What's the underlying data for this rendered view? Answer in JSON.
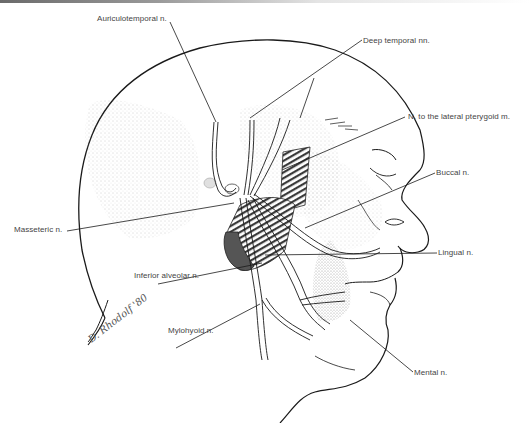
{
  "figure": {
    "signature": "D. Rhodolf '80",
    "colors": {
      "ink": "#1a1a1a",
      "label_text": "#444444",
      "stipple": "#9a9a9a",
      "muscle_dark": "#555555",
      "background": "#ffffff"
    }
  },
  "labels": {
    "auriculotemporal": "Auriculotemporal n.",
    "deep_temporal": "Deep temporal nn.",
    "lateral_pterygoid": "N. to the lateral pterygoid m.",
    "buccal": "Buccal n.",
    "masseteric": "Masseteric n.",
    "inferior_alveolar": "Inferior alveolar n.",
    "lingual": "Lingual n.",
    "mylohyoid": "Mylohyoid n.",
    "mental": "Mental n."
  }
}
